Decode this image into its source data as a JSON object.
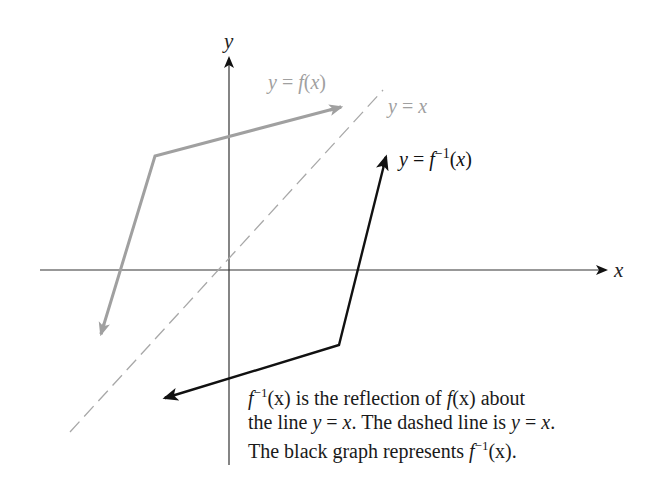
{
  "diagram": {
    "axis_labels": {
      "x": "x",
      "y": "y"
    },
    "curves": {
      "f": {
        "label_prefix": "y = ",
        "label_fn": "f",
        "label_arg": "(x)",
        "color": "#a0a0a0"
      },
      "identity": {
        "label": "y = x",
        "color": "#a8a8a8",
        "style": "dashed"
      },
      "f_inverse": {
        "label_prefix": "y = ",
        "label_fn": "f",
        "label_sup": "−1",
        "label_arg": "(x)",
        "color": "#111111"
      }
    },
    "caption": {
      "line1": [
        "f",
        "−1",
        "(x) is the reflection of ",
        "f",
        "(x) about"
      ],
      "line2": [
        "the line ",
        "y",
        " = ",
        "x",
        ". The dashed line is ",
        "y",
        " = ",
        "x",
        "."
      ],
      "line3": [
        "The black graph represents ",
        "f",
        "−1",
        "(x)."
      ]
    }
  }
}
